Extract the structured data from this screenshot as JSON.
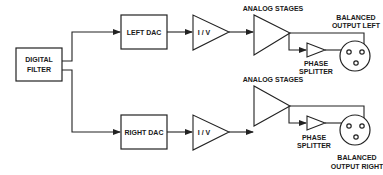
{
  "diagram": {
    "title": "",
    "blocks": {
      "digital_filter": {
        "line1": "DIGITAL",
        "line2": "FILTER"
      },
      "left_dac": "LEFT DAC",
      "right_dac": "RIGHT DAC",
      "iv_left": "I / V",
      "iv_right": "I / V"
    },
    "labels": {
      "analog_stages_left": "ANALOG STAGES",
      "analog_stages_right": "ANALOG STAGES",
      "phase_splitter_left": {
        "line1": "PHASE",
        "line2": "SPLITTER"
      },
      "phase_splitter_right": {
        "line1": "PHASE",
        "line2": "SPLITTER"
      },
      "balanced_left": {
        "line1": "BALANCED",
        "line2": "OUTPUT LEFT"
      },
      "balanced_right": {
        "line1": "BALANCED",
        "line2": "OUTPUT RIGHT"
      }
    },
    "colors": {
      "line": "#222222",
      "background": "#ffffff"
    }
  }
}
